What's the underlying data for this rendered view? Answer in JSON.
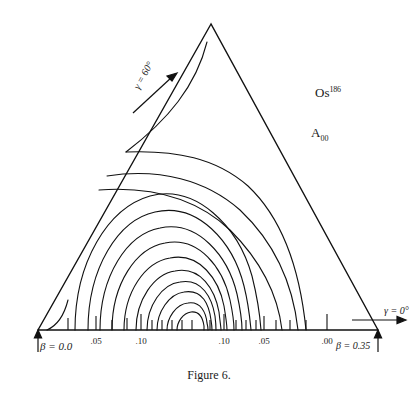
{
  "figure": {
    "caption": "Figure 6.",
    "isotope_symbol": "Os",
    "isotope_mass": "186",
    "surface_label": "A",
    "surface_sub": "00",
    "beta_min_label": "β = 0.0",
    "beta_max_label": "β = 0.35",
    "gamma_0_label": "γ = 0°",
    "gamma_60_label": "γ = 60°"
  },
  "chart_data": {
    "type": "line",
    "subtype": "contour-plot-triangular",
    "title": "Figure 6.",
    "xlabel": "β",
    "ylabel": "γ",
    "grid": false,
    "legend": "none",
    "annotations": [
      "Os186",
      "A00",
      "β = 0.0",
      "β = 0.35",
      "γ = 0°",
      "γ = 60°"
    ],
    "axis_domain": {
      "beta": [
        0.0,
        0.35
      ],
      "gamma": [
        0,
        60
      ]
    },
    "xlim": [
      0.0,
      0.35
    ],
    "ylim": [
      0,
      60
    ],
    "tick_labels": [
      ".05",
      ".10",
      ".10",
      ".05",
      ".00"
    ],
    "tick_positions_beta": [
      0.09,
      0.15,
      0.21,
      0.245,
      0.305
    ],
    "tick_label_values": [
      0.05,
      0.1,
      0.1,
      0.05,
      0.0
    ],
    "minimum": {
      "beta": 0.19,
      "gamma": 0
    },
    "contour_count": 14
  },
  "axis_ticks": [
    {
      "x": 96,
      "label": ".05"
    },
    {
      "x": 141,
      "label": ".10"
    },
    {
      "x": 224,
      "label": ".10"
    },
    {
      "x": 264,
      "label": ".05"
    },
    {
      "x": 327,
      "label": ".00"
    }
  ]
}
